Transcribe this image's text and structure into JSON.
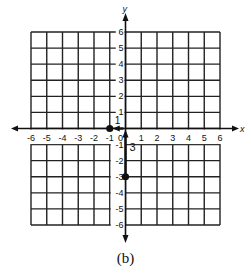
{
  "figure": {
    "caption": "(b)",
    "x_axis_label": "x",
    "y_axis_label": "y",
    "x_ticks": [
      "-6",
      "-5",
      "-4",
      "-3",
      "-2",
      "-1",
      "0",
      "1",
      "2",
      "3",
      "4",
      "5",
      "6"
    ],
    "y_ticks": [
      "6",
      "5",
      "4",
      "3",
      "2",
      "1",
      "-1",
      "-2",
      "-3",
      "-4",
      "-5",
      "-6"
    ],
    "x_range": [
      -6,
      6
    ],
    "y_range": [
      -6,
      6
    ],
    "points": [
      {
        "x": -1,
        "y": 0
      },
      {
        "x": 0,
        "y": -3
      }
    ],
    "vectors": [
      {
        "from": [
          0,
          -3
        ],
        "to": [
          0,
          0
        ],
        "label": "3"
      },
      {
        "from": [
          0,
          0
        ],
        "to": [
          -1,
          0
        ],
        "label": "1"
      }
    ],
    "vector_labels": {
      "vertical": "3",
      "horizontal": "1"
    }
  }
}
